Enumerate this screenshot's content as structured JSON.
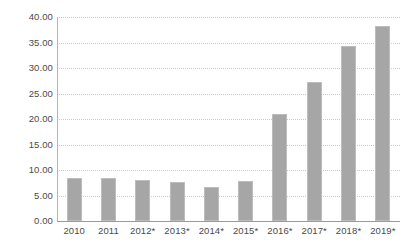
{
  "chart_data": {
    "type": "bar",
    "title": "",
    "subtitle": "",
    "xlabel": "",
    "ylabel": "",
    "categories": [
      "2010",
      "2011",
      "2012*",
      "2013*",
      "2014*",
      "2015*",
      "2016*",
      "2017*",
      "2018*",
      "2019*"
    ],
    "values": [
      8.5,
      8.4,
      8.0,
      7.6,
      6.7,
      7.8,
      20.9,
      27.2,
      34.4,
      38.3
    ],
    "ylim": [
      0,
      40
    ],
    "ytick_values": [
      0,
      5,
      10,
      15,
      20,
      25,
      30,
      35,
      40
    ],
    "ytick_labels": [
      "0.00",
      "5.00",
      "10.00",
      "15.00",
      "20.00",
      "25.00",
      "30.00",
      "35.00",
      "40.00"
    ],
    "grid": true,
    "grid_axis": "y",
    "grid_style": "dotted",
    "legend": false,
    "legend_position": "none",
    "series": [
      {
        "name": "",
        "values": [
          8.5,
          8.4,
          8.0,
          7.6,
          6.7,
          7.8,
          20.9,
          27.2,
          34.4,
          38.3
        ]
      }
    ],
    "annotations": []
  },
  "colors": {
    "bar_fill": "#a6a6a6",
    "bar_border": "#bdbdbd",
    "gridline": "#c9c9c9",
    "axis_line": "#9a9a9a",
    "tick_text": "#4a4a4a",
    "background": "#ffffff"
  }
}
